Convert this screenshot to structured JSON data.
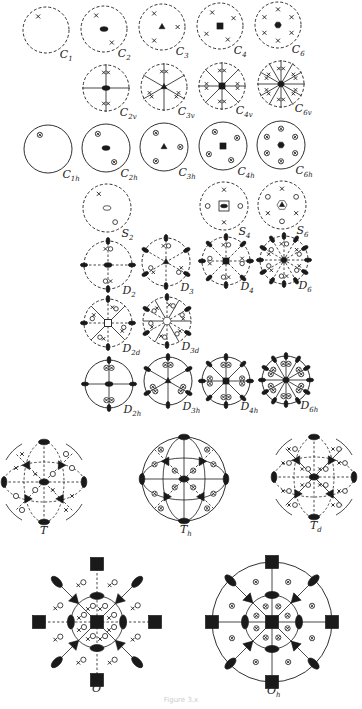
{
  "figure": {
    "caption": "Figure 3.x",
    "ink_color": "#1a1a1a",
    "legend": {
      "x": "general pole above plane",
      "o": "general pole below plane",
      "ox": "coincident poles above and below",
      "dashed-circle": "no mirror in projection plane",
      "solid-circle": "horizontal mirror plane",
      "ellipse": "2-fold axis",
      "triangle": "3-fold axis",
      "square": "4-fold axis",
      "hexagon": "6-fold axis"
    }
  },
  "groups": [
    {
      "name": "C",
      "sub": "1",
      "cx": 46,
      "cy": 30,
      "r": 23,
      "n": 1,
      "type": "Cn"
    },
    {
      "name": "C",
      "sub": "2",
      "cx": 104,
      "cy": 29,
      "r": 23,
      "n": 2,
      "type": "Cn"
    },
    {
      "name": "C",
      "sub": "3",
      "cx": 162,
      "cy": 27,
      "r": 23,
      "n": 3,
      "type": "Cn"
    },
    {
      "name": "C",
      "sub": "4",
      "cx": 220,
      "cy": 26,
      "r": 23,
      "n": 4,
      "type": "Cn"
    },
    {
      "name": "C",
      "sub": "6",
      "cx": 278,
      "cy": 25,
      "r": 23,
      "n": 6,
      "type": "Cn"
    },
    {
      "name": "C",
      "sub": "2v",
      "cx": 106,
      "cy": 88,
      "r": 23,
      "n": 2,
      "type": "Cnv"
    },
    {
      "name": "C",
      "sub": "3v",
      "cx": 164,
      "cy": 87,
      "r": 23,
      "n": 3,
      "type": "Cnv"
    },
    {
      "name": "C",
      "sub": "4v",
      "cx": 222,
      "cy": 86,
      "r": 23,
      "n": 4,
      "type": "Cnv"
    },
    {
      "name": "C",
      "sub": "6v",
      "cx": 281,
      "cy": 84,
      "r": 23,
      "n": 6,
      "type": "Cnv"
    },
    {
      "name": "C",
      "sub": "1h",
      "cx": 48,
      "cy": 149,
      "r": 24,
      "n": 1,
      "type": "Cnh"
    },
    {
      "name": "C",
      "sub": "2h",
      "cx": 106,
      "cy": 148,
      "r": 24,
      "n": 2,
      "type": "Cnh"
    },
    {
      "name": "C",
      "sub": "3h",
      "cx": 164,
      "cy": 147,
      "r": 24,
      "n": 3,
      "type": "Cnh"
    },
    {
      "name": "C",
      "sub": "4h",
      "cx": 223,
      "cy": 146,
      "r": 24,
      "n": 4,
      "type": "Cnh"
    },
    {
      "name": "C",
      "sub": "6h",
      "cx": 281,
      "cy": 145,
      "r": 24,
      "n": 6,
      "type": "Cnh"
    },
    {
      "name": "S",
      "sub": "2",
      "cx": 107,
      "cy": 208,
      "r": 24,
      "n": 2,
      "type": "Sn"
    },
    {
      "name": "S",
      "sub": "4",
      "cx": 224,
      "cy": 206,
      "r": 24,
      "n": 4,
      "type": "Sn"
    },
    {
      "name": "S",
      "sub": "6",
      "cx": 282,
      "cy": 205,
      "r": 24,
      "n": 6,
      "type": "Sn"
    },
    {
      "name": "D",
      "sub": "2",
      "cx": 108,
      "cy": 265,
      "r": 24,
      "n": 2,
      "type": "Dn"
    },
    {
      "name": "D",
      "sub": "3",
      "cx": 166,
      "cy": 262,
      "r": 24,
      "n": 3,
      "type": "Dn"
    },
    {
      "name": "D",
      "sub": "4",
      "cx": 226,
      "cy": 261,
      "r": 24,
      "n": 4,
      "type": "Dn"
    },
    {
      "name": "D",
      "sub": "6",
      "cx": 284,
      "cy": 260,
      "r": 24,
      "n": 6,
      "type": "Dn"
    },
    {
      "name": "D",
      "sub": "2d",
      "cx": 108,
      "cy": 323,
      "r": 24,
      "n": 2,
      "type": "Dnd"
    },
    {
      "name": "D",
      "sub": "3d",
      "cx": 167,
      "cy": 321,
      "r": 24,
      "n": 3,
      "type": "Dnd"
    },
    {
      "name": "D",
      "sub": "2h",
      "cx": 109,
      "cy": 384,
      "r": 24,
      "n": 2,
      "type": "Dnh"
    },
    {
      "name": "D",
      "sub": "3h",
      "cx": 168,
      "cy": 381,
      "r": 24,
      "n": 3,
      "type": "Dnh"
    },
    {
      "name": "D",
      "sub": "4h",
      "cx": 226,
      "cy": 381,
      "r": 24,
      "n": 4,
      "type": "Dnh"
    },
    {
      "name": "D",
      "sub": "6h",
      "cx": 286,
      "cy": 380,
      "r": 24,
      "n": 6,
      "type": "Dnh"
    }
  ],
  "cubic": [
    {
      "name": "T",
      "sub": "",
      "cx": 44,
      "cy": 482,
      "r": 40,
      "type": "T"
    },
    {
      "name": "T",
      "sub": "h",
      "cx": 184,
      "cy": 479,
      "r": 42,
      "type": "Th"
    },
    {
      "name": "T",
      "sub": "d",
      "cx": 314,
      "cy": 477,
      "r": 40,
      "type": "Td"
    },
    {
      "name": "O",
      "sub": "",
      "cx": 97,
      "cy": 622,
      "r": 58,
      "type": "O"
    },
    {
      "name": "O",
      "sub": "h",
      "cx": 272,
      "cy": 622,
      "r": 60,
      "type": "Oh"
    }
  ]
}
